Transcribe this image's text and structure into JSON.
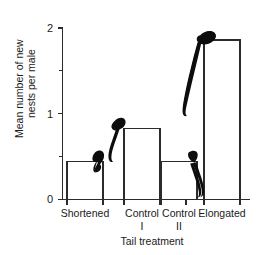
{
  "chart_data": {
    "type": "bar",
    "title": "",
    "xlabel": "Tail treatment",
    "ylabel": "Mean number of new nests per male",
    "categories": [
      "Shortened",
      "Control I",
      "Control II",
      "Elongated"
    ],
    "values": [
      0.44,
      0.83,
      0.44,
      1.86
    ],
    "ylim": [
      0,
      2
    ],
    "yticks": [
      0,
      1,
      2
    ],
    "ytick_labels": [
      "0",
      "1",
      "2"
    ],
    "yminor_ticks": [
      0.5,
      1.5
    ],
    "grid": false,
    "legend": null,
    "bar_fill": "#ffffff",
    "bar_stroke": "#2b2b2b",
    "annotations": [
      {
        "name": "swallow-shortened",
        "note": "swallow silhouette with short tail perched on bar 1"
      },
      {
        "name": "swallow-control-i",
        "note": "swallow silhouette with medium tail perched on bar 2"
      },
      {
        "name": "swallow-control-ii",
        "note": "swallow silhouette with medium tail perched on bar 3"
      },
      {
        "name": "swallow-elongated",
        "note": "swallow silhouette with very long tail perched on bar 4"
      }
    ]
  },
  "axes": {
    "y_label_line_1": "Mean number of new",
    "y_label_line_2": "nests per male",
    "x_title": "Tail treatment",
    "ytick_0": "0",
    "ytick_1": "1",
    "ytick_2": "2"
  },
  "categories": {
    "c0_line1": "Shortened",
    "c0_line2": "",
    "c1_line1": "Control",
    "c1_line2": "I",
    "c2_line1": "Control",
    "c2_line2": "II",
    "c3_line1": "Elongated",
    "c3_line2": ""
  }
}
